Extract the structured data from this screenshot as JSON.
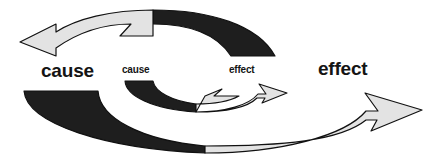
{
  "diagram": {
    "type": "cyclic-arrow-diagram",
    "background_color": "#ffffff",
    "colors": {
      "light_fill": "#e3e3e3",
      "dark_fill": "#1e1e1e",
      "outline": "#111111",
      "text": "#141414"
    },
    "labels": {
      "cause_outer": "cause",
      "cause_inner": "cause",
      "effect_inner": "effect",
      "effect_outer": "effect"
    },
    "loops": [
      {
        "name": "outer-loop",
        "segments": [
          {
            "name": "outer-top-arrow",
            "fill": "light",
            "direction": "left",
            "arrowhead": "left"
          },
          {
            "name": "outer-top-right-arc",
            "fill": "dark",
            "direction": "clockwise",
            "arrowhead": "none"
          },
          {
            "name": "outer-bottom-left-arc",
            "fill": "dark",
            "direction": "clockwise",
            "arrowhead": "none"
          },
          {
            "name": "outer-bottom-arrow",
            "fill": "light",
            "direction": "right",
            "arrowhead": "right"
          }
        ]
      },
      {
        "name": "inner-loop",
        "segments": [
          {
            "name": "inner-top-arrow",
            "fill": "light",
            "direction": "left",
            "arrowhead": "left"
          },
          {
            "name": "inner-top-right-arc",
            "fill": "dark",
            "direction": "clockwise",
            "arrowhead": "none"
          },
          {
            "name": "inner-bottom-left-arc",
            "fill": "dark",
            "direction": "clockwise",
            "arrowhead": "none"
          },
          {
            "name": "inner-bottom-arrow",
            "fill": "light",
            "direction": "right",
            "arrowhead": "right"
          }
        ]
      }
    ]
  }
}
